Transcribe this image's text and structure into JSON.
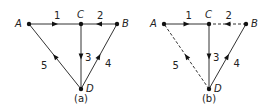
{
  "diagrams": [
    {
      "caption": "(a)",
      "nodes": [
        {
          "id": "A",
          "label": "A"
        },
        {
          "id": "C",
          "label": "C"
        },
        {
          "id": "B",
          "label": "B"
        },
        {
          "id": "D",
          "label": "D"
        }
      ],
      "edges": [
        {
          "label": "1",
          "from": "A",
          "to": "C",
          "dashed": false
        },
        {
          "label": "2",
          "from": "B",
          "to": "C",
          "dashed": false
        },
        {
          "label": "3",
          "from": "C",
          "to": "D",
          "dashed": false
        },
        {
          "label": "4",
          "from": "D",
          "to": "B",
          "dashed": false
        },
        {
          "label": "5",
          "from": "D",
          "to": "A",
          "dashed": false
        }
      ]
    },
    {
      "caption": "(b)",
      "nodes": [
        {
          "id": "A",
          "label": "A"
        },
        {
          "id": "C",
          "label": "C"
        },
        {
          "id": "B",
          "label": "B"
        },
        {
          "id": "D",
          "label": "D"
        }
      ],
      "edges": [
        {
          "label": "1",
          "from": "A",
          "to": "C",
          "dashed": false
        },
        {
          "label": "2",
          "from": "B",
          "to": "C",
          "dashed": true
        },
        {
          "label": "3",
          "from": "C",
          "to": "D",
          "dashed": false
        },
        {
          "label": "4",
          "from": "D",
          "to": "B",
          "dashed": false
        },
        {
          "label": "5",
          "from": "D",
          "to": "A",
          "dashed": true
        }
      ]
    }
  ]
}
